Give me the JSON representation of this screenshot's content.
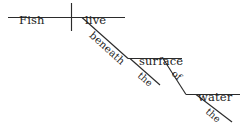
{
  "diagram": {
    "type": "reed-kellogg-sentence-diagram",
    "sentence": "Fish live beneath the surface of the water.",
    "canvas": {
      "width": 243,
      "height": 123,
      "background": "#ffffff"
    },
    "ink_color": "#2b2b2b",
    "text_color": "#1c1c1c",
    "words": [
      {
        "id": "subject",
        "text": "Fish",
        "role": "subject",
        "placement": "baseline-1-left",
        "x": 19,
        "y": 15,
        "rotation": 0,
        "size": "normal"
      },
      {
        "id": "verb",
        "text": "live",
        "role": "verb",
        "placement": "baseline-1-right",
        "x": 85,
        "y": 15,
        "rotation": 0,
        "size": "normal"
      },
      {
        "id": "prep-beneath",
        "text": "beneath",
        "role": "preposition",
        "placement": "diagonal-1",
        "x": 88,
        "y": 27,
        "rotation": 42,
        "size": "slanted"
      },
      {
        "id": "object-surface",
        "text": "surface",
        "role": "object-of-preposition",
        "placement": "baseline-2",
        "x": 139,
        "y": 56,
        "rotation": 0,
        "size": "normal"
      },
      {
        "id": "article-the-1",
        "text": "the",
        "role": "article",
        "placement": "diagonal-2",
        "x": 136,
        "y": 68,
        "rotation": 42,
        "size": "slanted-small"
      },
      {
        "id": "prep-of",
        "text": "of",
        "role": "preposition",
        "placement": "diagonal-3",
        "x": 170,
        "y": 66,
        "rotation": 42,
        "size": "slanted-small"
      },
      {
        "id": "object-water",
        "text": "water",
        "role": "object-of-preposition",
        "placement": "baseline-3",
        "x": 198,
        "y": 92,
        "rotation": 0,
        "size": "normal"
      },
      {
        "id": "article-the-2",
        "text": "the",
        "role": "article",
        "placement": "diagonal-4",
        "x": 204,
        "y": 104,
        "rotation": 42,
        "size": "slanted-small"
      }
    ],
    "strokes": [
      {
        "id": "baseline-1",
        "kind": "horizontal",
        "x1": 8,
        "y1": 17.5,
        "x2": 125,
        "y2": 17.5
      },
      {
        "id": "subject-verb-divider",
        "kind": "vertical",
        "x1": 71.5,
        "y1": 3,
        "x2": 71.5,
        "y2": 31
      },
      {
        "id": "prep-slant-beneath",
        "kind": "diagonal",
        "x1": 82,
        "y1": 17.5,
        "x2": 128,
        "y2": 58.5
      },
      {
        "id": "baseline-2",
        "kind": "horizontal",
        "x1": 128,
        "y1": 58.5,
        "x2": 182,
        "y2": 58.5
      },
      {
        "id": "article-slant-the-1",
        "kind": "diagonal",
        "x1": 130,
        "y1": 58.5,
        "x2": 160,
        "y2": 85
      },
      {
        "id": "prep-slant-of",
        "kind": "diagonal",
        "x1": 163,
        "y1": 58.5,
        "x2": 186,
        "y2": 94.5
      },
      {
        "id": "baseline-3",
        "kind": "horizontal",
        "x1": 186,
        "y1": 94.5,
        "x2": 240,
        "y2": 94.5
      },
      {
        "id": "article-slant-the-2",
        "kind": "diagonal",
        "x1": 196,
        "y1": 94.5,
        "x2": 232,
        "y2": 122
      }
    ]
  }
}
